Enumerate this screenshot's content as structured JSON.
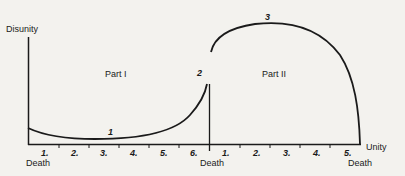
{
  "diagram": {
    "y_axis_label": "Disunity",
    "x_axis_end_label": "Unity",
    "parts": [
      {
        "label": "Part I"
      },
      {
        "label": "Part II"
      }
    ],
    "curve_markers": [
      "1",
      "2",
      "3"
    ],
    "part1_ticks": [
      "1.",
      "2.",
      "3.",
      "4.",
      "5.",
      "6."
    ],
    "part2_ticks": [
      "1.",
      "2.",
      "3.",
      "4.",
      "5."
    ],
    "death_labels": [
      "Death",
      "Death",
      "Death"
    ],
    "stroke_color": "#1a1a1a",
    "background": "#f3f2ee"
  }
}
